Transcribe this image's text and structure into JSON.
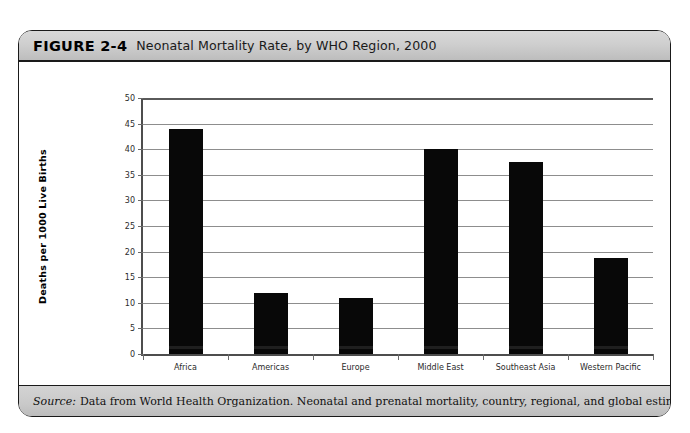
{
  "figure": {
    "number": "FIGURE 2-4",
    "title": "Neonatal Mortality Rate, by WHO Region, 2000",
    "source_label": "Source:",
    "source_text": "Data from World Health Organization. Neonatal and prenatal mortality, country, regional, and global estimates. Geneva: WHO; 2006:Annex 2."
  },
  "chart_data": {
    "type": "bar",
    "title": "Neonatal Mortality Rate, by WHO Region, 2000",
    "xlabel": "WHO REGION",
    "ylabel": "Deaths per 1000 Live Births",
    "categories": [
      "Africa",
      "Americas",
      "Europe",
      "Middle East",
      "Southeast Asia",
      "Western Pacific"
    ],
    "values": [
      44,
      12,
      11,
      40,
      37.5,
      18.7
    ],
    "ylim": [
      0,
      50
    ],
    "yticks": [
      0,
      5,
      10,
      15,
      20,
      25,
      30,
      35,
      40,
      45,
      50
    ],
    "ytick_labels": [
      "0",
      "5",
      "10",
      "15",
      "20",
      "25",
      "30",
      "35",
      "40",
      "45",
      "50"
    ],
    "grid": true,
    "legend": false,
    "bar_color": "#080808"
  }
}
